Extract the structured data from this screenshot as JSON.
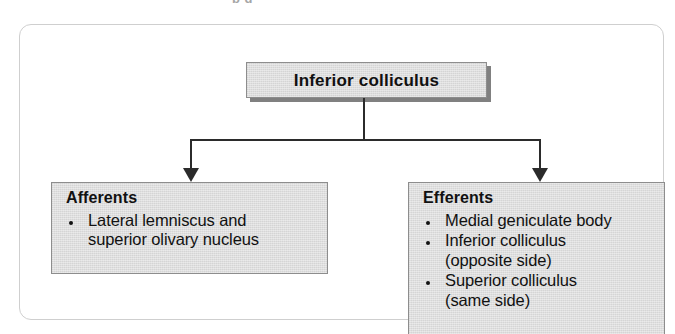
{
  "page": {
    "top_sliver_text": "p g",
    "background_color": "#ffffff"
  },
  "diagram": {
    "type": "hierarchy-flowchart",
    "panel_border_color": "#cfcfcf",
    "box_fill_color": "#dedede",
    "box_border_color": "#8d8d8d",
    "connector_color": "#2b2b2b",
    "shadow_color": "#808080",
    "root": {
      "label": "Inferior colliculus"
    },
    "branches": [
      {
        "heading": "Afferents",
        "items": [
          {
            "main": "Lateral lemniscus and",
            "sub": "superior olivary nucleus"
          }
        ]
      },
      {
        "heading": "Efferents",
        "items": [
          {
            "main": "Medial geniculate body",
            "sub": ""
          },
          {
            "main": "Inferior colliculus",
            "sub": "(opposite side)"
          },
          {
            "main": "Superior colliculus",
            "sub": "(same side)"
          }
        ]
      }
    ]
  }
}
